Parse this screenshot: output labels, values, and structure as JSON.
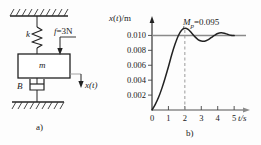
{
  "figure": {
    "panel_a": {
      "caption": "a)",
      "labels": {
        "spring": "k",
        "mass": "m",
        "damper": "B",
        "force": "f =3N",
        "displacement": "x(t)"
      },
      "icons": {
        "ceiling": "ground-hatch-icon",
        "floor": "ground-hatch-icon",
        "spring": "spring-coil-icon",
        "damper": "dashpot-icon",
        "force_arrow": "down-arrow-icon",
        "displacement_arrow": "down-arrow-icon"
      }
    },
    "panel_b": {
      "caption": "b)",
      "annotation": {
        "symbol": "M",
        "subscript": "p",
        "equals_value": "=0.095"
      }
    }
  },
  "chart_data": {
    "type": "line",
    "title": "",
    "xlabel": "t/s",
    "ylabel": "x(t)/m",
    "xlim": [
      0,
      5.6
    ],
    "ylim": [
      0,
      0.0118
    ],
    "xticks": [
      0,
      1,
      2,
      3,
      4,
      5
    ],
    "xticklabels": [
      "0",
      "1",
      "2",
      "3",
      "4",
      "5"
    ],
    "yticks": [
      0.002,
      0.004,
      0.006,
      0.008,
      0.01
    ],
    "yticklabels": [
      "0.002",
      "0.004",
      "0.006",
      "0.008",
      "0.010"
    ],
    "grid": false,
    "legend": null,
    "reference_line": {
      "label": "steady-state",
      "y": 0.01,
      "style": "solid",
      "color": "#8a8a8a"
    },
    "peak_marker": {
      "label": "Mp=0.095",
      "t": 2.0,
      "y": 0.01095,
      "style": "dashed",
      "color": "#9a9a9a"
    },
    "series": [
      {
        "name": "x(t)",
        "color": "#222222",
        "x": [
          0.0,
          0.2,
          0.4,
          0.6,
          0.8,
          1.0,
          1.2,
          1.4,
          1.6,
          1.8,
          2.0,
          2.2,
          2.4,
          2.6,
          2.8,
          3.0,
          3.2,
          3.4,
          3.6,
          3.8,
          4.0,
          4.2,
          4.4,
          4.6,
          4.8,
          5.0
        ],
        "y": [
          0.0,
          0.00075,
          0.0017,
          0.0029,
          0.0043,
          0.0058,
          0.0074,
          0.0088,
          0.00995,
          0.0107,
          0.01095,
          0.0108,
          0.01035,
          0.00985,
          0.00945,
          0.00925,
          0.00922,
          0.0094,
          0.0097,
          0.01,
          0.01025,
          0.01035,
          0.0103,
          0.01015,
          0.01002,
          0.00998
        ]
      }
    ]
  }
}
